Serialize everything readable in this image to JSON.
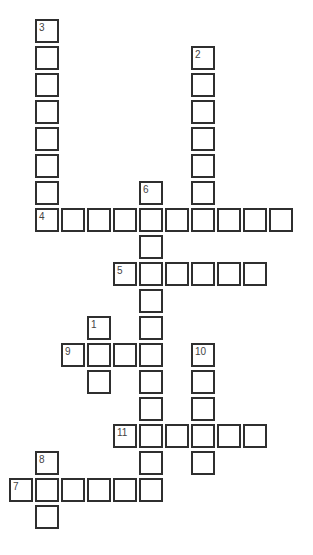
{
  "puzzle": {
    "grid": {
      "origin_x": 9,
      "origin_y": 19,
      "pitch_x": 26,
      "pitch_y": 27
    },
    "colors": {
      "border": "#2f2f2f",
      "label": "#444444",
      "background": "#ffffff"
    },
    "entries": [
      {
        "number": "1",
        "direction": "down",
        "row": 11,
        "col": 3,
        "length": 3
      },
      {
        "number": "2",
        "direction": "down",
        "row": 1,
        "col": 7,
        "length": 7
      },
      {
        "number": "3",
        "direction": "down",
        "row": 0,
        "col": 1,
        "length": 8
      },
      {
        "number": "4",
        "direction": "across",
        "row": 7,
        "col": 1,
        "length": 10
      },
      {
        "number": "5",
        "direction": "across",
        "row": 9,
        "col": 4,
        "length": 6
      },
      {
        "number": "6",
        "direction": "down",
        "row": 6,
        "col": 5,
        "length": 12
      },
      {
        "number": "7",
        "direction": "across",
        "row": 17,
        "col": 0,
        "length": 6
      },
      {
        "number": "8",
        "direction": "down",
        "row": 16,
        "col": 1,
        "length": 3
      },
      {
        "number": "9",
        "direction": "across",
        "row": 12,
        "col": 2,
        "length": 4
      },
      {
        "number": "10",
        "direction": "down",
        "row": 12,
        "col": 7,
        "length": 5
      },
      {
        "number": "11",
        "direction": "across",
        "row": 15,
        "col": 4,
        "length": 6
      }
    ]
  }
}
